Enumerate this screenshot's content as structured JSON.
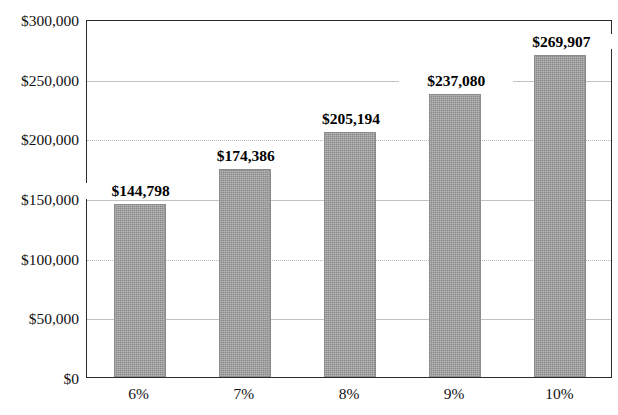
{
  "chart_data": {
    "type": "bar",
    "title": "",
    "subtitle": "",
    "xlabel": "",
    "ylabel": "",
    "categories": [
      "6%",
      "7%",
      "8%",
      "9%",
      "10%"
    ],
    "values": [
      144798,
      174386,
      205194,
      237080,
      269907
    ],
    "value_labels": [
      "$144,798",
      "$174,386",
      "$205,194",
      "$237,080",
      "$269,907"
    ],
    "ylim": [
      0,
      300000
    ],
    "ytick_values": [
      0,
      50000,
      100000,
      150000,
      200000,
      250000,
      300000
    ],
    "ytick_labels": [
      "$0",
      "$50,000",
      "$100,000",
      "$150,000",
      "$200,000",
      "$250,000",
      "$300,000"
    ],
    "grid": true,
    "grid_axis": "y",
    "legend": false,
    "legend_position": "none",
    "series": [
      {
        "name": "Value",
        "values": [
          144798,
          174386,
          205194,
          237080,
          269907
        ]
      }
    ],
    "colors": {
      "bar_fill": "#9a9a9a",
      "bar_edge": "#8c8c8c",
      "gridline": "#c2c2c2",
      "axis": "#2b2b2b",
      "text": "#111111",
      "background": "#ffffff"
    }
  }
}
